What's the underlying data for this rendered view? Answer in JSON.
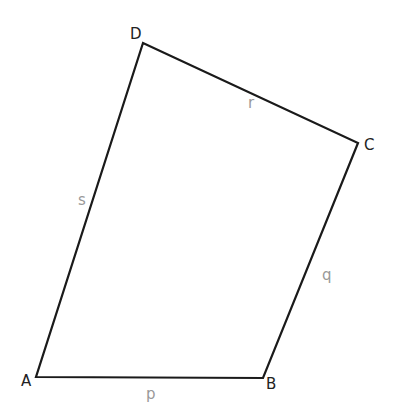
{
  "diagram": {
    "type": "quadrilateral",
    "colors": {
      "edge": "#1a1a1a",
      "vertex_label": "#222222",
      "side_label": "#999999",
      "background": "#ffffff"
    },
    "vertices": [
      {
        "label": "A",
        "x": 36,
        "y": 377,
        "lx": 21,
        "ly": 386
      },
      {
        "label": "B",
        "x": 263,
        "y": 378,
        "lx": 266,
        "ly": 389
      },
      {
        "label": "C",
        "x": 358,
        "y": 143,
        "lx": 364,
        "ly": 150
      },
      {
        "label": "D",
        "x": 143,
        "y": 43,
        "lx": 130,
        "ly": 39
      }
    ],
    "sides": [
      {
        "label": "p",
        "from": "A",
        "to": "B",
        "lx": 146,
        "ly": 399
      },
      {
        "label": "q",
        "from": "B",
        "to": "C",
        "lx": 322,
        "ly": 280
      },
      {
        "label": "r",
        "from": "C",
        "to": "D",
        "lx": 248,
        "ly": 108
      },
      {
        "label": "s",
        "from": "D",
        "to": "A",
        "lx": 78,
        "ly": 205
      }
    ]
  }
}
